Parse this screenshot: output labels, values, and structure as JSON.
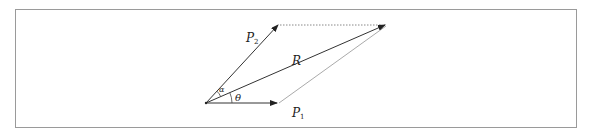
{
  "figure": {
    "labels": {
      "P2": {
        "text": "P",
        "sub": "2"
      },
      "P1": {
        "text": "P",
        "sub": "1"
      },
      "R": {
        "text": "R"
      },
      "alpha": {
        "text": "α"
      },
      "theta": {
        "text": "θ"
      }
    },
    "points": {
      "origin": [
        206,
        103
      ],
      "P1_tip": [
        277,
        103
      ],
      "P2_tip": [
        278,
        25
      ],
      "R_tip": [
        386,
        25
      ]
    },
    "colors": {
      "vector": "#333333",
      "dotted": "#888888",
      "side": "#aaaaaa",
      "frame": "#9a9a9a"
    }
  }
}
